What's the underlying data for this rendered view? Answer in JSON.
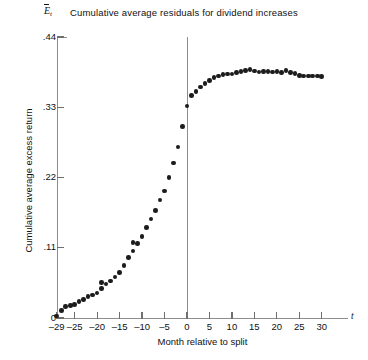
{
  "chart_data": {
    "type": "scatter",
    "title": "Cumulative average residuals for dividend increases",
    "xlabel": "Month relative to split",
    "ylabel": "Cumulative average excess return",
    "y_symbol_base": "E",
    "y_symbol_sub": "t",
    "x_symbol": "t",
    "xlim": [
      -30,
      31
    ],
    "ylim": [
      0,
      0.44
    ],
    "grid": false,
    "legend": "none",
    "xticks": [
      -29,
      -25,
      -20,
      -15,
      -10,
      -5,
      0,
      5,
      10,
      15,
      20,
      25,
      30
    ],
    "xtick_labels": [
      "–29",
      "–25",
      "–20",
      "–15",
      "–10",
      "–5",
      "0",
      "5",
      "10",
      "15",
      "20",
      "25",
      "30"
    ],
    "yticks": [
      0,
      0.11,
      0.22,
      0.33,
      0.44
    ],
    "ytick_labels": [
      "0",
      ".11",
      ".22",
      ".33",
      ".44"
    ],
    "annotations": [
      {
        "name": "zero-reference-line",
        "x": 0,
        "description": "vertical line at month 0 (split month)"
      }
    ],
    "x": [
      -29,
      -28,
      -27,
      -26,
      -25,
      -24,
      -23,
      -22,
      -21,
      -20,
      -19,
      -19,
      -18,
      -17,
      -16,
      -15,
      -14,
      -13,
      -12,
      -12,
      -11,
      -10,
      -9,
      -8,
      -7,
      -6,
      -5,
      -4,
      -3,
      -2,
      -1,
      0,
      1,
      2,
      3,
      4,
      5,
      6,
      7,
      8,
      9,
      10,
      11,
      12,
      13,
      14,
      15,
      16,
      17,
      18,
      19,
      20,
      21,
      22,
      23,
      24,
      25,
      26,
      27,
      28,
      29,
      30
    ],
    "values": [
      0.003,
      0.012,
      0.018,
      0.02,
      0.021,
      0.026,
      0.029,
      0.034,
      0.036,
      0.039,
      0.046,
      0.056,
      0.053,
      0.058,
      0.064,
      0.071,
      0.082,
      0.095,
      0.105,
      0.118,
      0.117,
      0.128,
      0.142,
      0.155,
      0.168,
      0.185,
      0.199,
      0.22,
      0.243,
      0.268,
      0.3,
      0.332,
      0.348,
      0.355,
      0.362,
      0.367,
      0.372,
      0.377,
      0.379,
      0.381,
      0.382,
      0.382,
      0.384,
      0.386,
      0.388,
      0.389,
      0.387,
      0.385,
      0.386,
      0.386,
      0.385,
      0.386,
      0.384,
      0.388,
      0.384,
      0.383,
      0.38,
      0.379,
      0.379,
      0.379,
      0.379,
      0.378
    ]
  }
}
